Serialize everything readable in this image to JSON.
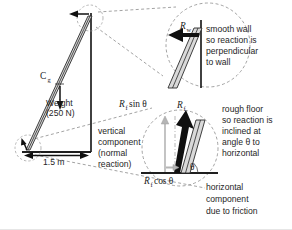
{
  "figure": {
    "colors": {
      "ladder_fill": "#d9d9d9",
      "ladder_outline": "#2b2b2b",
      "arrow_black": "#101010",
      "arrow_grey": "#b5b5b5",
      "callout_dash": "#8c8c8c",
      "text": "#262626",
      "background": "#ffffff"
    }
  },
  "main_diagram": {
    "centre_of_gravity_label": "C",
    "centre_of_gravity_sub": "g",
    "weight_label_line1": "Weight",
    "weight_label_line2": "(250 N)",
    "base_distance_label": "1.5 m",
    "normal_note_line1": "vertical",
    "normal_note_line2": "component",
    "normal_note_line3": "(normal",
    "normal_note_line4": "reaction)"
  },
  "wall_callout": {
    "force_symbol": "R",
    "force_subscript": "w",
    "note_line1": "smooth wall",
    "note_line2": "so reaction is",
    "note_line3": "perpendicular",
    "note_line4": "to wall"
  },
  "floor_callout": {
    "resultant_symbol": "R",
    "resultant_subscript": "f",
    "vertical_component_label": "R_f sin θ",
    "vertical_symbol": "R",
    "vertical_subscript": "f",
    "vertical_function": "sin θ",
    "horizontal_symbol": "R",
    "horizontal_subscript": "f",
    "horizontal_function": "cos θ",
    "angle_label": "θ",
    "note_line1": "rough floor",
    "note_line2": "so reaction is",
    "note_line3": "inclined at",
    "note_line4": "angle θ to",
    "note_line5": "horizontal",
    "friction_note_line1": "horizontal",
    "friction_note_line2": "component",
    "friction_note_line3": "due to friction"
  }
}
